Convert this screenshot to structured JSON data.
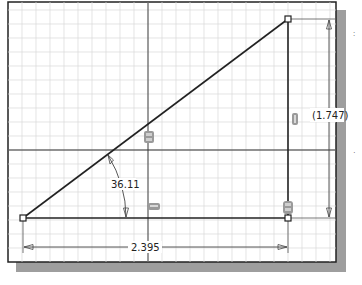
{
  "sketch": {
    "colors": {
      "background": "#ffffff",
      "grid_minor": "#d8d8d8",
      "grid_major": "#333333",
      "frame": "#222222",
      "shadow": "#9a9a9a",
      "geometry": "#222222",
      "dimension": "#333333",
      "constraint_glyph": "#8a8a8a"
    },
    "frame": {
      "x": 8,
      "y": 2,
      "width": 328,
      "height": 260
    },
    "grid_spacing": 14,
    "axes": {
      "vertical_x": 148,
      "horizontal_y": 150
    },
    "vertices": [
      {
        "name": "bottom-left",
        "x": 23,
        "y": 218
      },
      {
        "name": "top-right",
        "x": 288,
        "y": 19
      },
      {
        "name": "bottom-right",
        "x": 288,
        "y": 218
      }
    ],
    "dimensions": {
      "angle": {
        "label": "36.11",
        "x": 110,
        "y": 188
      },
      "horizontal": {
        "label": "2.395",
        "x": 158,
        "y": 251
      },
      "vertical": {
        "label": "(1.747)",
        "x": 314,
        "y": 119
      }
    },
    "constraints": [
      {
        "type": "coincident",
        "icon": "coincident-constraint-icon",
        "x": 149,
        "y": 137
      },
      {
        "type": "horizontal",
        "icon": "horizontal-constraint-icon",
        "x": 154,
        "y": 207
      },
      {
        "type": "vertical",
        "icon": "vertical-constraint-icon",
        "x": 291,
        "y": 118
      },
      {
        "type": "perpendicular-coincident",
        "icon": "perpendicular-constraint-icon",
        "x": 288,
        "y": 207
      }
    ],
    "side_marks": [
      ":",
      "·"
    ]
  }
}
